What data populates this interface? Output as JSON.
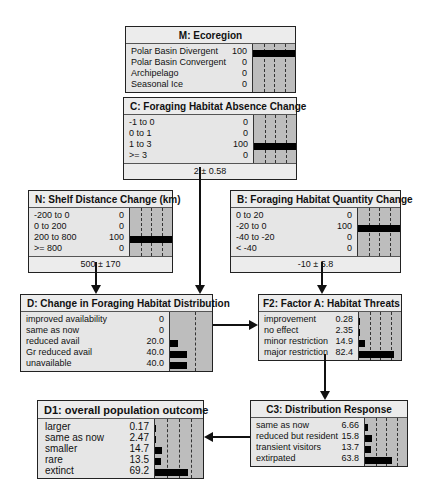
{
  "nodes": {
    "M": {
      "title": "M: Ecoregion",
      "states": [
        {
          "label": "Polar Basin Divergent",
          "value": "100",
          "pct": 100
        },
        {
          "label": "Polar Basin Convergent",
          "value": "0",
          "pct": 0
        },
        {
          "label": "Archipelago",
          "value": "0",
          "pct": 0
        },
        {
          "label": "Seasonal Ice",
          "value": "0",
          "pct": 0
        }
      ]
    },
    "C": {
      "title": "C: Foraging Habitat Absence Change",
      "states": [
        {
          "label": "-1 to 0",
          "value": "0",
          "pct": 0
        },
        {
          "label": "0 to 1",
          "value": "0",
          "pct": 0
        },
        {
          "label": "1 to 3",
          "value": "100",
          "pct": 100
        },
        {
          "label": ">= 3",
          "value": "0",
          "pct": 0
        }
      ],
      "footer": "2 ± 0.58"
    },
    "N": {
      "title": "N: Shelf Distance Change (km)",
      "states": [
        {
          "label": "-200 to 0",
          "value": "0",
          "pct": 0
        },
        {
          "label": "0 to 200",
          "value": "0",
          "pct": 0
        },
        {
          "label": "200 to 800",
          "value": "100",
          "pct": 100
        },
        {
          "label": ">= 800",
          "value": "0",
          "pct": 0
        }
      ],
      "footer": "500 ± 170"
    },
    "B": {
      "title": "B: Foraging Habitat Quantity Change",
      "states": [
        {
          "label": "0 to 20",
          "value": "0",
          "pct": 0
        },
        {
          "label": "-20 to 0",
          "value": "100",
          "pct": 100
        },
        {
          "label": "-40 to -20",
          "value": "0",
          "pct": 0
        },
        {
          "label": "< -40",
          "value": "0",
          "pct": 0
        }
      ],
      "footer": "-10 ± 5.8"
    },
    "D": {
      "title": "D: Change in Foraging Habitat Distribution",
      "states": [
        {
          "label": "improved availability",
          "value": "0",
          "pct": 0
        },
        {
          "label": "same as now",
          "value": "0",
          "pct": 0
        },
        {
          "label": "reduced avail",
          "value": "20.0",
          "pct": 20.0
        },
        {
          "label": "Gr reduced avail",
          "value": "40.0",
          "pct": 40.0
        },
        {
          "label": "unavailable",
          "value": "40.0",
          "pct": 40.0
        }
      ]
    },
    "F2": {
      "title": "F2: Factor A: Habitat Threats",
      "states": [
        {
          "label": "improvement",
          "value": "0.28",
          "pct": 0.28
        },
        {
          "label": "no effect",
          "value": "2.35",
          "pct": 2.35
        },
        {
          "label": "minor restriction",
          "value": "14.9",
          "pct": 14.9
        },
        {
          "label": "major restriction",
          "value": "82.4",
          "pct": 82.4
        }
      ]
    },
    "D1": {
      "title": "D1: overall population outcome",
      "states": [
        {
          "label": "larger",
          "value": "0.17",
          "pct": 0.17
        },
        {
          "label": "same as now",
          "value": "2.47",
          "pct": 2.47
        },
        {
          "label": "smaller",
          "value": "14.7",
          "pct": 14.7
        },
        {
          "label": "rare",
          "value": "13.5",
          "pct": 13.5
        },
        {
          "label": "extinct",
          "value": "69.2",
          "pct": 69.2
        }
      ]
    },
    "C3": {
      "title": "C3: Distribution Response",
      "states": [
        {
          "label": "same as now",
          "value": "6.66",
          "pct": 6.66
        },
        {
          "label": "reduced but resident",
          "value": "15.8",
          "pct": 15.8
        },
        {
          "label": "transient visitors",
          "value": "13.7",
          "pct": 13.7
        },
        {
          "label": "extirpated",
          "value": "63.8",
          "pct": 63.8
        }
      ]
    }
  },
  "edges": [
    {
      "from": "C",
      "to": "D"
    },
    {
      "from": "N",
      "to": "D"
    },
    {
      "from": "B",
      "to": "F2"
    },
    {
      "from": "D",
      "to": "F2"
    },
    {
      "from": "F2",
      "to": "C3"
    },
    {
      "from": "C3",
      "to": "D1"
    }
  ],
  "colors": {
    "node_bg": "#e6e6e6",
    "bar_area": "#bdbdbd",
    "bar": "#000000",
    "border": "#222222"
  }
}
